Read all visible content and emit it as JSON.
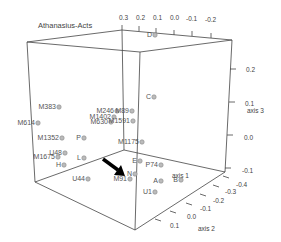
{
  "chart_data": {
    "type": "scatter",
    "title": "Athanasius-Acts",
    "axes": {
      "x": {
        "label": "axis 1",
        "ticks": [
          "0.3",
          "0.2",
          "0.1",
          "0.0",
          "-0.1",
          "-0.2"
        ]
      },
      "y": {
        "label": "axis 2",
        "ticks": [
          "0.1",
          "0.0",
          "-0.1",
          "-0.2",
          "-0.3",
          "-0.4"
        ]
      },
      "z": {
        "label": "axis 3",
        "ticks": [
          "0.2",
          "0.1",
          "0.0",
          "-0.1"
        ]
      }
    },
    "annotation": "black arrow pointing to M91 cluster",
    "points": [
      {
        "label": "D",
        "x": 153,
        "y": 37
      },
      {
        "label": "M383",
        "x": 57,
        "y": 109
      },
      {
        "label": "M614",
        "x": 36,
        "y": 125
      },
      {
        "label": "M246",
        "x": 115,
        "y": 113
      },
      {
        "label": "M1402",
        "x": 112,
        "y": 119
      },
      {
        "label": "M630",
        "x": 109,
        "y": 124
      },
      {
        "label": "M1591",
        "x": 131,
        "y": 123
      },
      {
        "label": "M89",
        "x": 130,
        "y": 113
      },
      {
        "label": "C",
        "x": 152,
        "y": 99
      },
      {
        "label": "M1352",
        "x": 60,
        "y": 140
      },
      {
        "label": "P",
        "x": 82,
        "y": 140
      },
      {
        "label": "M1175",
        "x": 140,
        "y": 144
      },
      {
        "label": "U48",
        "x": 63,
        "y": 155
      },
      {
        "label": "M1675",
        "x": 56,
        "y": 159
      },
      {
        "label": "L",
        "x": 82,
        "y": 160
      },
      {
        "label": "H",
        "x": 62,
        "y": 167
      },
      {
        "label": "E",
        "x": 138,
        "y": 163
      },
      {
        "label": "P74",
        "x": 159,
        "y": 167
      },
      {
        "label": "A",
        "x": 159,
        "y": 183
      },
      {
        "label": "B",
        "x": 179,
        "y": 182
      },
      {
        "label": "U44",
        "x": 86,
        "y": 181
      },
      {
        "label": "M91",
        "x": 128,
        "y": 181
      },
      {
        "label": "N",
        "x": 133,
        "y": 176
      },
      {
        "label": "U1",
        "x": 153,
        "y": 194
      }
    ]
  }
}
